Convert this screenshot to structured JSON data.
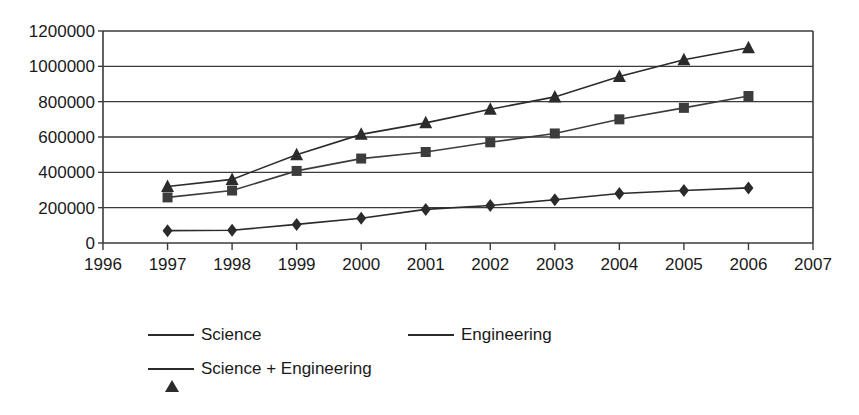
{
  "chart_data": {
    "type": "line",
    "title": "",
    "xlabel": "",
    "ylabel": "",
    "x": [
      1997,
      1998,
      1999,
      2000,
      2001,
      2002,
      2003,
      2004,
      2005,
      2006
    ],
    "xlim": [
      1996,
      2007
    ],
    "ylim": [
      0,
      1200000
    ],
    "ytick_labels": [
      "1200000",
      "1000000",
      "800000",
      "600000",
      "400000",
      "200000",
      "0"
    ],
    "ytick_values": [
      1200000,
      1000000,
      800000,
      600000,
      400000,
      200000,
      0
    ],
    "xtick_labels": [
      "1996",
      "1997",
      "1998",
      "1999",
      "2000",
      "2001",
      "2002",
      "2003",
      "2004",
      "2005",
      "2006",
      "2007"
    ],
    "grid": true,
    "legend_position": "bottom",
    "series": [
      {
        "name": "Science",
        "marker": "diamond",
        "color": "#2b2b2b",
        "values": [
          70000,
          72000,
          105000,
          140000,
          190000,
          212000,
          245000,
          280000,
          297000,
          312000
        ]
      },
      {
        "name": "Engineering",
        "marker": "square",
        "color": "#3c3c3c",
        "values": [
          258000,
          297000,
          408000,
          478000,
          515000,
          570000,
          620000,
          700000,
          765000,
          832000
        ]
      },
      {
        "name": "Science + Engineering",
        "marker": "triangle",
        "color": "#2b2b2b",
        "values": [
          320000,
          360000,
          500000,
          615000,
          680000,
          757000,
          827000,
          942000,
          1037000,
          1105000
        ]
      }
    ]
  },
  "legend": {
    "items": [
      {
        "label": "Science",
        "marker": "diamond"
      },
      {
        "label": "Engineering",
        "marker": "square"
      },
      {
        "label": "Science + Engineering",
        "marker": "triangle"
      }
    ]
  }
}
